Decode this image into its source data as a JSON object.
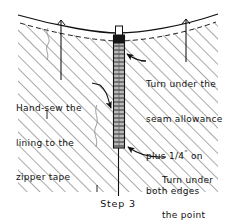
{
  "figure": {
    "title": "Step 3",
    "caption": "Step 3",
    "colors": {
      "ink": "#111111",
      "hatch": "#555555",
      "paper": "#ffffff",
      "zipper_tape": "#8a8a8a",
      "zipper_slider": "#1a1a1a"
    }
  },
  "annotations": {
    "right": {
      "lines": [
        "Turn under the",
        "seam allowance",
        "plus ",
        "both edges"
      ],
      "line1": "Turn under the",
      "line2": "seam allowance",
      "line3_prefix": "plus 1/4",
      "line3_quote": "”",
      "line3_suffix": " on",
      "line4": "both edges",
      "full_text": "Turn under the seam allowance plus 1/4” on both edges"
    },
    "left": {
      "line1": "Hand-sew the",
      "line2": "lining to the",
      "line3": "zipper tape",
      "full_text": "Hand-sew the lining to the zipper tape"
    },
    "point": {
      "line1": "Turn under",
      "line2": "the point",
      "full_text": "Turn under the point"
    }
  },
  "elements": {
    "fabric_panel": "hatched fabric area",
    "zipper": "closed zipper with teeth",
    "zipper_slider": "zipper pull slider",
    "top_edge": "curved upper edge of garment",
    "fold_line": "dashed fold / seam allowance line",
    "center_seam": "vertical center seam below zipper"
  }
}
